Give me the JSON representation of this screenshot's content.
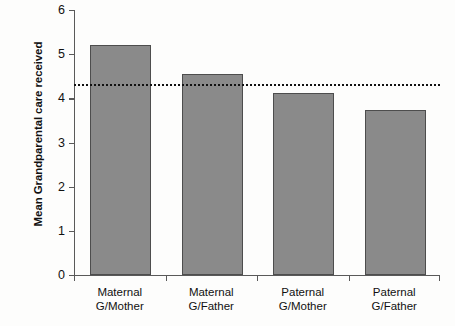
{
  "chart_data": {
    "type": "bar",
    "title": "",
    "xlabel": "",
    "ylabel": "Mean Grandparental care received",
    "categories": [
      "Maternal G/Mother",
      "Maternal G/Father",
      "Paternal G/Mother",
      "Paternal G/Father"
    ],
    "category_lines": [
      [
        "Maternal",
        "G/Mother"
      ],
      [
        "Maternal",
        "G/Father"
      ],
      [
        "Paternal",
        "G/Mother"
      ],
      [
        "Paternal",
        "G/Father"
      ]
    ],
    "values": [
      5.2,
      4.55,
      4.12,
      3.73
    ],
    "ylim": [
      0,
      6
    ],
    "yticks": [
      0,
      1,
      2,
      3,
      4,
      5,
      6
    ],
    "ytick_labels": [
      "0",
      "1",
      "2",
      "3",
      "4",
      "5",
      "6"
    ],
    "grid": false,
    "legend": false,
    "annotations": [
      {
        "name": "overall-mean-reference-line",
        "type": "horizontal-dashed-line",
        "value": 4.32,
        "style": "dotted",
        "color": "#111111"
      }
    ],
    "bar_color": "#8a8a8a",
    "bar_edge_color": "#4d4d4d",
    "axis_color": "#595959"
  }
}
